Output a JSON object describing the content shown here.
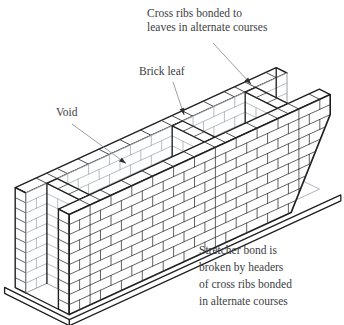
{
  "figure": {
    "kind": "diaphragm-wall-isometric-diagram"
  },
  "labels": {
    "cross_ribs": {
      "lines": {
        "0": "Cross ribs bonded to",
        "1": "leaves in alternate courses"
      }
    },
    "brick_leaf": {
      "lines": {
        "0": "Brick leaf"
      }
    },
    "void": {
      "lines": {
        "0": "Void"
      }
    },
    "stretcher_bond": {
      "lines": {
        "0": "Stretcher bond is",
        "1": "broken by headers",
        "2": "of cross ribs bonded",
        "3": "in alternate courses"
      }
    }
  },
  "colors": {
    "background": "#ffffff",
    "ink": "#1f1f1f",
    "joint": "#3a3a3a",
    "light": "#9aa0a6",
    "leader": "#9a9ea6",
    "arrow": "#2f2f2f",
    "text": "#3c4043"
  }
}
